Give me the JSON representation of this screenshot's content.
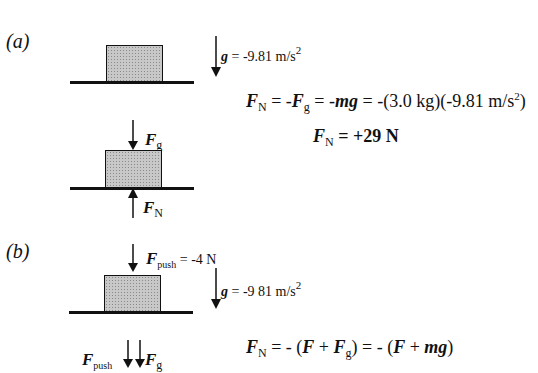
{
  "panels": {
    "a": {
      "label": "(a)",
      "gravity": {
        "symbol": "g",
        "text": " = -9.81 m/s",
        "exp": "2"
      },
      "fbd": {
        "top_force": {
          "sym": "F",
          "sub": "g"
        },
        "bottom_force": {
          "sym": "F",
          "sub": "N"
        }
      },
      "equation1": {
        "lhs_sym": "F",
        "lhs_sub": "N",
        "p1": " = -",
        "f_sym": "F",
        "f_sub": "g",
        "p2": " = -",
        "mg": "mg",
        "p3": " = -(3.0 kg)(-9.81 m/s",
        "exp": "2",
        "p4": ")"
      },
      "equation2": {
        "sym": "F",
        "sub": "N",
        "rest": " = +29 N"
      }
    },
    "b": {
      "label": "(b)",
      "push": {
        "sym": "F",
        "sub": "push",
        "text": " = -4 N"
      },
      "gravity": {
        "symbol": "g",
        "text": " = -9 81 m/s",
        "exp": "2"
      },
      "fbd": {
        "push_label": {
          "sym": "F",
          "sub": "push"
        },
        "g_label": {
          "sym": "F",
          "sub": "g"
        }
      },
      "equation": {
        "lhs_sym": "F",
        "lhs_sub": "N",
        "p1": " = - (",
        "f1": "F",
        "plus1": " + ",
        "f2": "F",
        "f2_sub": "g",
        "p2": ") = - (",
        "f3": "F",
        "plus2": " + ",
        "mg": "mg",
        "p3": ")"
      }
    }
  }
}
